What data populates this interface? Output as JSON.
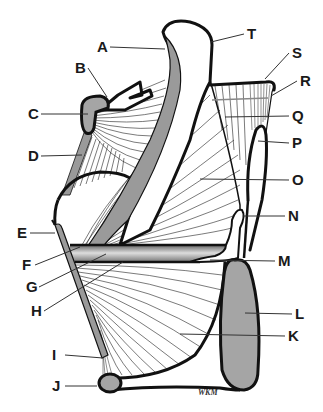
{
  "diagram": {
    "type": "anatomical-illustration",
    "background": "#ffffff",
    "structure_fill": "#9a9a9a",
    "outline_color": "#111111",
    "signature": "WKM",
    "labels": [
      {
        "id": "A",
        "text": "A",
        "x": 97,
        "y": 52,
        "target": [
          165,
          49
        ]
      },
      {
        "id": "B",
        "text": "B",
        "x": 75,
        "y": 73,
        "target": [
          107,
          97
        ]
      },
      {
        "id": "C",
        "text": "C",
        "x": 28,
        "y": 119,
        "target": [
          88,
          114
        ]
      },
      {
        "id": "D",
        "text": "D",
        "x": 28,
        "y": 161,
        "target": [
          82,
          155
        ]
      },
      {
        "id": "E",
        "text": "E",
        "x": 17,
        "y": 238,
        "target": [
          55,
          233
        ]
      },
      {
        "id": "F",
        "text": "F",
        "x": 22,
        "y": 270,
        "target": [
          80,
          247
        ]
      },
      {
        "id": "G",
        "text": "G",
        "x": 26,
        "y": 292,
        "target": [
          106,
          254
        ]
      },
      {
        "id": "H",
        "text": "H",
        "x": 31,
        "y": 316,
        "target": [
          123,
          262
        ]
      },
      {
        "id": "I",
        "text": "I",
        "x": 52,
        "y": 360,
        "target": [
          103,
          358
        ]
      },
      {
        "id": "J",
        "text": "J",
        "x": 52,
        "y": 391,
        "target": [
          97,
          386
        ]
      },
      {
        "id": "K",
        "text": "K",
        "x": 288,
        "y": 341,
        "target": [
          180,
          334
        ]
      },
      {
        "id": "L",
        "text": "L",
        "x": 295,
        "y": 319,
        "target": [
          245,
          313
        ]
      },
      {
        "id": "M",
        "text": "M",
        "x": 278,
        "y": 266,
        "target": [
          210,
          260
        ]
      },
      {
        "id": "N",
        "text": "N",
        "x": 288,
        "y": 221,
        "target": [
          243,
          216
        ]
      },
      {
        "id": "O",
        "text": "O",
        "x": 292,
        "y": 185,
        "target": [
          200,
          179
        ]
      },
      {
        "id": "P",
        "text": "P",
        "x": 292,
        "y": 148,
        "target": [
          258,
          141
        ]
      },
      {
        "id": "Q",
        "text": "Q",
        "x": 292,
        "y": 121,
        "target": [
          225,
          117
        ]
      },
      {
        "id": "R",
        "text": "R",
        "x": 300,
        "y": 86,
        "target": [
          271,
          96
        ]
      },
      {
        "id": "S",
        "text": "S",
        "x": 292,
        "y": 58,
        "target": [
          265,
          79
        ]
      },
      {
        "id": "T",
        "text": "T",
        "x": 247,
        "y": 39,
        "target": [
          211,
          42
        ]
      }
    ]
  }
}
